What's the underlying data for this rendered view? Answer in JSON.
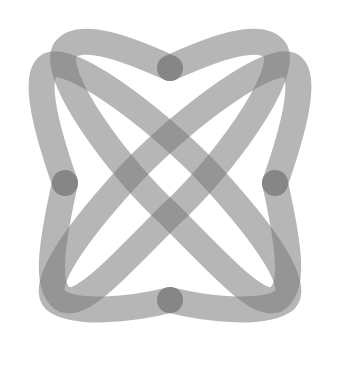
{
  "graphic": {
    "type": "logo",
    "description": "Four overlapping semi-transparent gray looped strokes forming a symmetric knot",
    "stroke_color": "#7a7a7a",
    "stroke_opacity": 0.55,
    "background": "#ffffff",
    "nodes": [
      "top",
      "left",
      "right",
      "bottom"
    ]
  }
}
